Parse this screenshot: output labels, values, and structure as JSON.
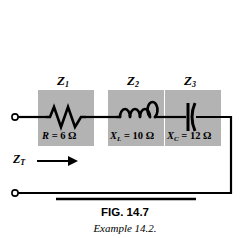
{
  "figure": {
    "caption_title": "FIG. 14.7",
    "caption_subtitle": "Example 14.2.",
    "background_color": "#ffffff",
    "wire_color": "#000000",
    "block_fill_color": "#b3b3b3"
  },
  "circuit": {
    "total_impedance_label": "Z",
    "total_impedance_sub": "T",
    "terminals": [
      {
        "name": "top-left-terminal",
        "x": 15,
        "y": 117
      },
      {
        "name": "bottom-left-terminal",
        "x": 15,
        "y": 193
      }
    ],
    "elements": [
      {
        "id": "Z1",
        "symbol": "resistor",
        "block_label": "Z",
        "block_label_sub": "1",
        "value_symbol": "R",
        "value_symbol_sub": "",
        "value_text": "= 6 Ω",
        "value_number": 6,
        "value_unit": "Ω",
        "box": {
          "x": 38,
          "y": 90,
          "w": 56,
          "h": 56
        }
      },
      {
        "id": "Z2",
        "symbol": "inductor",
        "block_label": "Z",
        "block_label_sub": "2",
        "value_symbol": "X",
        "value_symbol_sub": "L",
        "value_text": "= 10 Ω",
        "value_number": 10,
        "value_unit": "Ω",
        "box": {
          "x": 108,
          "y": 90,
          "w": 56,
          "h": 56
        }
      },
      {
        "id": "Z3",
        "symbol": "capacitor",
        "block_label": "Z",
        "block_label_sub": "3",
        "value_symbol": "X",
        "value_symbol_sub": "C",
        "value_text": "= 12 Ω",
        "value_number": 12,
        "value_unit": "Ω",
        "box": {
          "x": 165,
          "y": 90,
          "w": 56,
          "h": 56
        }
      }
    ]
  }
}
